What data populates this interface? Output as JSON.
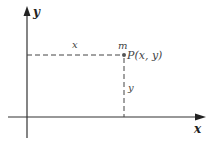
{
  "diagram": {
    "type": "coordinate-plane",
    "axes": {
      "x_label": "x",
      "y_label": "y"
    },
    "point": {
      "mass_label": "m",
      "label": "P(x, y)"
    },
    "guides": {
      "horizontal_label": "x",
      "vertical_label": "y"
    },
    "colors": {
      "axis": "#333333",
      "guide": "#444444",
      "point": "#555555"
    }
  }
}
